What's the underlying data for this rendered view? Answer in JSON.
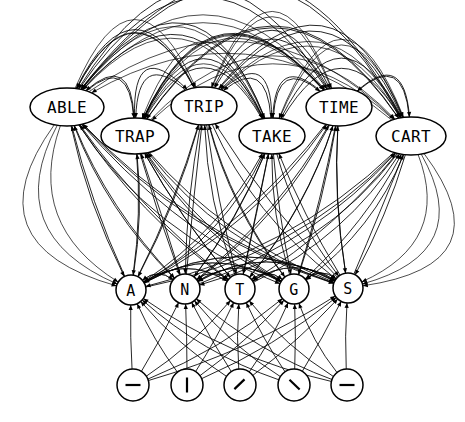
{
  "figure": {
    "background_color": "#ffffff",
    "edge_color": "#000000",
    "node_fill": "#ffffff",
    "node_stroke": "#000000",
    "width": 465,
    "height": 422
  },
  "tiers": {
    "words": {
      "name": "word-tier",
      "shape": "ellipse",
      "nodes": [
        {
          "id": "ABLE",
          "label": "ABLE",
          "cx": 67,
          "cy": 107,
          "rx": 37,
          "ry": 19
        },
        {
          "id": "TRAP",
          "label": "TRAP",
          "cx": 135,
          "cy": 136,
          "rx": 34,
          "ry": 18
        },
        {
          "id": "TRIP",
          "label": "TRIP",
          "cx": 204,
          "cy": 106,
          "rx": 33,
          "ry": 19
        },
        {
          "id": "TAKE",
          "label": "TAKE",
          "cx": 272,
          "cy": 136,
          "rx": 33,
          "ry": 18
        },
        {
          "id": "TIME",
          "label": "TIME",
          "cx": 339,
          "cy": 107,
          "rx": 33,
          "ry": 19
        },
        {
          "id": "CART",
          "label": "CART",
          "cx": 411,
          "cy": 136,
          "rx": 35,
          "ry": 19
        }
      ]
    },
    "letters": {
      "name": "letter-tier",
      "shape": "circle",
      "nodes": [
        {
          "id": "A",
          "label": "A",
          "cx": 131,
          "cy": 290,
          "r": 15
        },
        {
          "id": "N",
          "label": "N",
          "cx": 185,
          "cy": 289,
          "r": 15
        },
        {
          "id": "T",
          "label": "T",
          "cx": 240,
          "cy": 289,
          "r": 15
        },
        {
          "id": "G",
          "label": "G",
          "cx": 294,
          "cy": 289,
          "r": 15
        },
        {
          "id": "S",
          "label": "S",
          "cx": 348,
          "cy": 288,
          "r": 15
        }
      ]
    },
    "glyphs": {
      "name": "glyph-tier",
      "shape": "circle",
      "nodes": [
        {
          "id": "g1",
          "label": "dash-icon",
          "glyph": "dash",
          "cx": 133,
          "cy": 385,
          "r": 16
        },
        {
          "id": "g2",
          "label": "vertical-icon",
          "glyph": "vertical",
          "cx": 187,
          "cy": 385,
          "r": 16
        },
        {
          "id": "g3",
          "label": "slash-icon",
          "glyph": "slash",
          "cx": 240,
          "cy": 385,
          "r": 16
        },
        {
          "id": "g4",
          "label": "backslash-icon",
          "glyph": "backslash",
          "cx": 294,
          "cy": 385,
          "r": 16
        },
        {
          "id": "g5",
          "label": "dash-icon",
          "glyph": "dash",
          "cx": 347,
          "cy": 385,
          "r": 16
        }
      ]
    }
  },
  "edges": {
    "word_to_word_all_pairs": true,
    "word_to_letter_all_pairs": true,
    "glyph_to_letter_all_pairs": true,
    "arrowheads": true,
    "style": "curved"
  }
}
